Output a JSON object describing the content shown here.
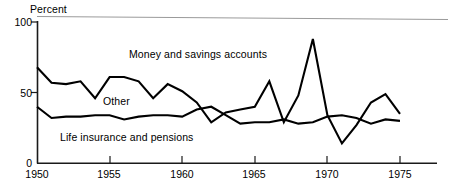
{
  "chart_data": {
    "type": "line",
    "title": "",
    "subtitle": "",
    "xlabel": "",
    "ylabel": "Percent",
    "unit_label": "Percent",
    "xlim": [
      1950,
      1975
    ],
    "ylim": [
      0,
      100
    ],
    "grid": false,
    "legend_position": "inline-annotations",
    "y_ticks": [
      "0",
      "50",
      "100"
    ],
    "y_tick_values": [
      0,
      50,
      100
    ],
    "x_ticks": [
      "1950",
      "1955",
      "1960",
      "1965",
      "1970",
      "1975"
    ],
    "x_tick_values": [
      1950,
      1955,
      1960,
      1965,
      1970,
      1975
    ],
    "x": [
      1950,
      1951,
      1952,
      1953,
      1954,
      1955,
      1956,
      1957,
      1958,
      1959,
      1960,
      1961,
      1962,
      1963,
      1964,
      1965,
      1966,
      1967,
      1968,
      1969,
      1970,
      1971,
      1972,
      1973,
      1974,
      1975
    ],
    "series": [
      {
        "name": "Money and savings accounts",
        "color": "#000000",
        "values": [
          68,
          57,
          56,
          58,
          46,
          61,
          61,
          58,
          46,
          56,
          51,
          43,
          29,
          36,
          38,
          40,
          58,
          29,
          48,
          88,
          34,
          14,
          27,
          43,
          49,
          35
        ]
      },
      {
        "name": "Life insurance and pensions",
        "color": "#000000",
        "values": [
          40,
          32,
          33,
          33,
          34,
          34,
          31,
          33,
          34,
          34,
          33,
          38,
          40,
          34,
          28,
          29,
          29,
          31,
          28,
          29,
          33,
          34,
          32,
          28,
          31,
          30
        ]
      }
    ],
    "annotations": [
      {
        "text": "Money and savings accounts",
        "x": 1956.5,
        "y": 83
      },
      {
        "text": "Other",
        "x": 1954.5,
        "y": 49
      },
      {
        "text": "Life insurance and pensions",
        "x": 1951.5,
        "y": 23
      }
    ]
  },
  "axis": {
    "unit_label": "Percent",
    "y_labels": {
      "top": "100",
      "mid": "50",
      "bottom": "0"
    },
    "x_labels": [
      "1950",
      "1955",
      "1960",
      "1965",
      "1970",
      "1975"
    ]
  },
  "labels": {
    "money": "Money and savings accounts",
    "other": "Other",
    "life": "Life insurance and pensions"
  },
  "colors": {
    "line": "#000000",
    "axis": "#1a1a1a",
    "top_rule": "#9a9a9a",
    "background": "#ffffff"
  }
}
